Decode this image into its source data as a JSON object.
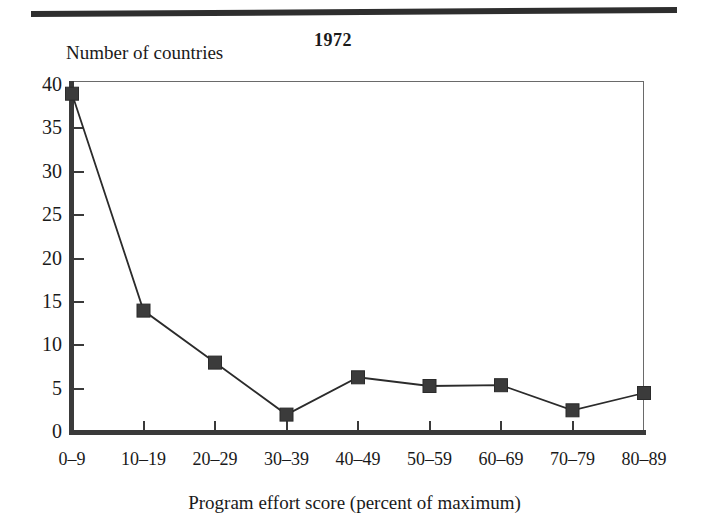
{
  "figure": {
    "title": "1972",
    "y_axis_title": "Number of countries",
    "x_axis_title": "Program effort score (percent of maximum)"
  },
  "chart_data": {
    "type": "line",
    "title": "1972",
    "xlabel": "Program effort score (percent of maximum)",
    "ylabel": "Number of countries",
    "categories": [
      "0–9",
      "10–19",
      "20–29",
      "30–39",
      "40–49",
      "50–59",
      "60–69",
      "70–79",
      "80–89"
    ],
    "values": [
      39,
      14,
      8,
      2,
      6.3,
      5.3,
      5.4,
      2.5,
      4.5
    ],
    "ylim": [
      0,
      40
    ],
    "yticks": [
      0,
      5,
      10,
      15,
      20,
      25,
      30,
      35,
      40
    ],
    "ytick_labels": [
      "0",
      "5",
      "10",
      "15",
      "20",
      "25",
      "30",
      "35",
      "40"
    ],
    "grid": false,
    "legend": null,
    "marker": "square",
    "line_color": "#2b2b2b",
    "marker_color": "#3b3b3b"
  }
}
